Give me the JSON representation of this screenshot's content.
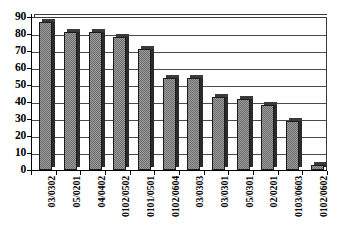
{
  "chart_data": {
    "type": "bar",
    "title": "",
    "subtitle": "",
    "xlabel": "",
    "ylabel": "",
    "categories": [
      "03/0302",
      "05/0201",
      "04/0402",
      "0102/0502",
      "0101/0501",
      "0102/0604",
      "03/0303",
      "03/0301",
      "05/0301",
      "02/0201",
      "0103/0603",
      "0102/0602"
    ],
    "values": [
      87,
      81,
      81,
      78,
      71,
      54,
      54,
      43,
      42,
      38,
      29,
      3
    ],
    "ylim": [
      0,
      90
    ],
    "ytick_step": 10,
    "yticks": [
      0,
      10,
      20,
      30,
      40,
      50,
      60,
      70,
      80,
      90
    ],
    "ytick_labels": [
      "0",
      "10",
      "20",
      "30",
      "40",
      "50",
      "60",
      "70",
      "80",
      "90"
    ],
    "grid": true,
    "grid_axis": "y",
    "legend": false,
    "legend_position": "none",
    "series": [
      {
        "name": "Series 1",
        "values": [
          87,
          81,
          81,
          78,
          71,
          54,
          54,
          43,
          42,
          38,
          29,
          3
        ]
      }
    ],
    "colors": {
      "bar_fill": "#9b9b9b",
      "bar_pattern": "#6e6e6e",
      "bar_border": "#1c1c1c",
      "bar_side_shadow": "#2a2a2a",
      "gridline": "#4a4a4a",
      "axis": "#000000",
      "background": "#ffffff",
      "text": "#000000"
    },
    "style": "3d-bar-greyscale-hatched",
    "annotations": []
  }
}
